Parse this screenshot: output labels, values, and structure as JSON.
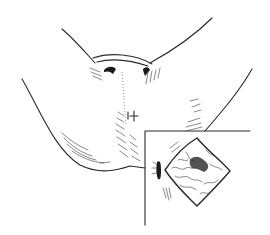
{
  "figure": {
    "type": "line-illustration",
    "style": "black ink on white",
    "colors": {
      "background": "#ffffff",
      "ink": "#2a2a2a"
    }
  },
  "main_view": {
    "marker_symbol": "+",
    "elements": [
      "left buttock outline",
      "right buttock outline",
      "upper thighs",
      "perineal fold",
      "midline raphe hatching",
      "skin fold hatching"
    ]
  },
  "inset": {
    "frame": {
      "x": 145,
      "y": 131,
      "width": 105,
      "height": 104
    },
    "elements": [
      "anal opening mark",
      "diamond-shaped lesion with cerebriform surface",
      "central puckered area",
      "radiating skin lines"
    ]
  }
}
